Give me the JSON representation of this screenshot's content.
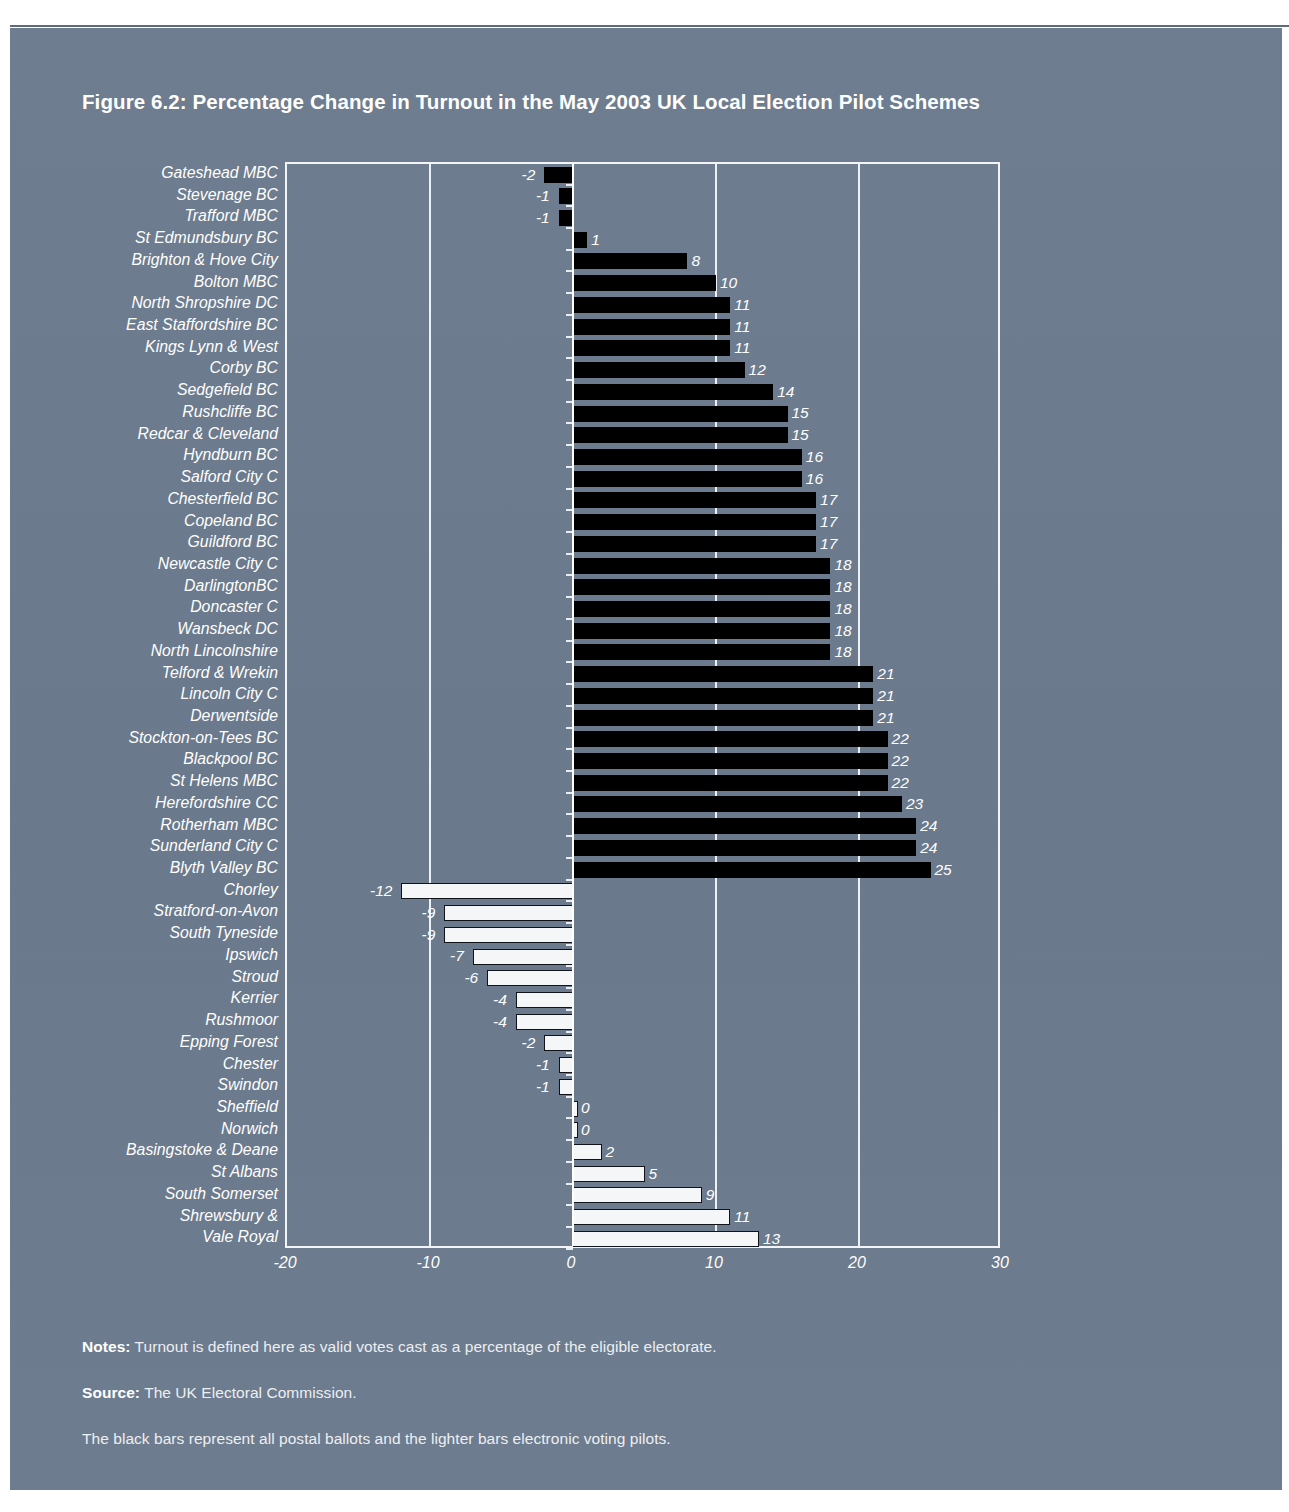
{
  "figure": {
    "title": "Figure 6.2: Percentage Change in Turnout in the May 2003 UK Local Election Pilot Schemes"
  },
  "footer": {
    "notes_label": "Notes:",
    "notes_text": " Turnout is defined here as valid votes cast as a percentage of the eligible electorate.",
    "source_label": "Source:",
    "source_text": " The UK Electoral Commission.",
    "legend_note": "The black bars represent all postal ballots and the lighter bars electronic voting pilots."
  },
  "colors": {
    "page_background": "#6c7b8d",
    "postal_bar": "#000000",
    "electronic_bar": "#f4f6f7",
    "axis": "#ffffff",
    "text": "#ffffff"
  },
  "chart_data": {
    "type": "bar",
    "orientation": "horizontal",
    "title": "Figure 6.2: Percentage Change in Turnout in the May 2003 UK Local Election Pilot Schemes",
    "xlabel": "",
    "ylabel": "",
    "xlim": [
      -20,
      30
    ],
    "xticks": [
      -20,
      -10,
      0,
      10,
      20,
      30
    ],
    "xtick_labels": [
      "-20",
      "-10",
      "0",
      "10",
      "20",
      "30"
    ],
    "grid": true,
    "legend_position": "none",
    "series": [
      {
        "name": "All postal ballots",
        "color": "#000000"
      },
      {
        "name": "Electronic voting pilots",
        "color": "#f4f6f7"
      }
    ],
    "categories": [
      "Gateshead MBC",
      "Stevenage BC",
      "Trafford MBC",
      "St Edmundsbury BC",
      "Brighton & Hove City",
      "Bolton MBC",
      "North Shropshire DC",
      "East Staffordshire BC",
      "Kings Lynn & West",
      "Corby BC",
      "Sedgefield BC",
      "Rushcliffe BC",
      "Redcar & Cleveland",
      "Hyndburn BC",
      "Salford City C",
      "Chesterfield BC",
      "Copeland BC",
      "Guildford BC",
      "Newcastle City C",
      "DarlingtonBC",
      "Doncaster C",
      "Wansbeck DC",
      "North Lincolnshire",
      "Telford & Wrekin",
      "Lincoln City C",
      "Derwentside",
      "Stockton-on-Tees BC",
      "Blackpool BC",
      "St Helens MBC",
      "Herefordshire CC",
      "Rotherham MBC",
      "Sunderland City C",
      "Blyth Valley BC",
      "Chorley",
      "Stratford-on-Avon",
      "South Tyneside",
      "Ipswich",
      "Stroud",
      "Kerrier",
      "Rushmoor",
      "Epping Forest",
      "Chester",
      "Swindon",
      "Sheffield",
      "Norwich",
      "Basingstoke & Deane",
      "St Albans",
      "South Somerset",
      "Shrewsbury &",
      "Vale Royal"
    ],
    "values": [
      -2,
      -1,
      -1,
      1,
      8,
      10,
      11,
      11,
      11,
      12,
      14,
      15,
      15,
      16,
      16,
      17,
      17,
      17,
      18,
      18,
      18,
      18,
      18,
      21,
      21,
      21,
      22,
      22,
      22,
      23,
      24,
      24,
      25,
      -12,
      -9,
      -9,
      -7,
      -6,
      -4,
      -4,
      -2,
      -1,
      -1,
      0,
      0,
      2,
      5,
      9,
      11,
      13
    ],
    "value_labels": [
      "-2",
      "-1",
      "-1",
      "1",
      "8",
      "10",
      "11",
      "11",
      "11",
      "12",
      "14",
      "15",
      "15",
      "16",
      "16",
      "17",
      "17",
      "17",
      "18",
      "18",
      "18",
      "18",
      "18",
      "21",
      "21",
      "21",
      "22",
      "22",
      "22",
      "23",
      "24",
      "24",
      "25",
      "-12",
      "-9",
      "-9",
      "-7",
      "-6",
      "-4",
      "-4",
      "-2",
      "-1",
      "-1",
      "0",
      "0",
      "2",
      "5",
      "9",
      "11",
      "13"
    ],
    "series_index": [
      0,
      0,
      0,
      0,
      0,
      0,
      0,
      0,
      0,
      0,
      0,
      0,
      0,
      0,
      0,
      0,
      0,
      0,
      0,
      0,
      0,
      0,
      0,
      0,
      0,
      0,
      0,
      0,
      0,
      0,
      0,
      0,
      0,
      1,
      1,
      1,
      1,
      1,
      1,
      1,
      1,
      1,
      1,
      1,
      1,
      1,
      1,
      1,
      1,
      1
    ]
  }
}
